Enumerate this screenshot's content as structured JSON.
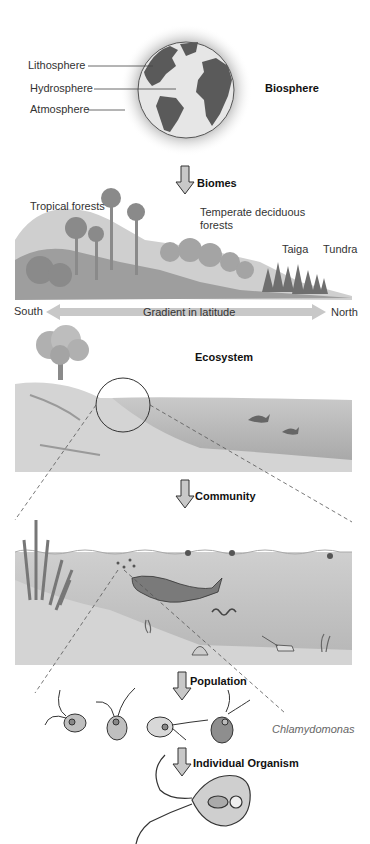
{
  "diagram": {
    "levels": [
      {
        "id": "biosphere",
        "label": "Biosphere"
      },
      {
        "id": "biomes",
        "label": "Biomes"
      },
      {
        "id": "ecosystem",
        "label": "Ecosystem"
      },
      {
        "id": "community",
        "label": "Community"
      },
      {
        "id": "population",
        "label": "Population"
      },
      {
        "id": "individual",
        "label": "Individual Organism"
      }
    ],
    "earth_layers": [
      "Lithosphere",
      "Hydrosphere",
      "Atmosphere"
    ],
    "biome_types": [
      "Tropical forests",
      "Temperate deciduous forests",
      "Taiga",
      "Tundra"
    ],
    "gradient": {
      "left": "South",
      "center": "Gradient in latitude",
      "right": "North"
    },
    "species_label": "Chlamydomonas"
  },
  "colors": {
    "land": "#5a5a5a",
    "ocean": "#e6e6e6",
    "arrow_fill": "#c8c8c8",
    "water": "#bdbdbd",
    "sediment": "#d4d4d4"
  }
}
